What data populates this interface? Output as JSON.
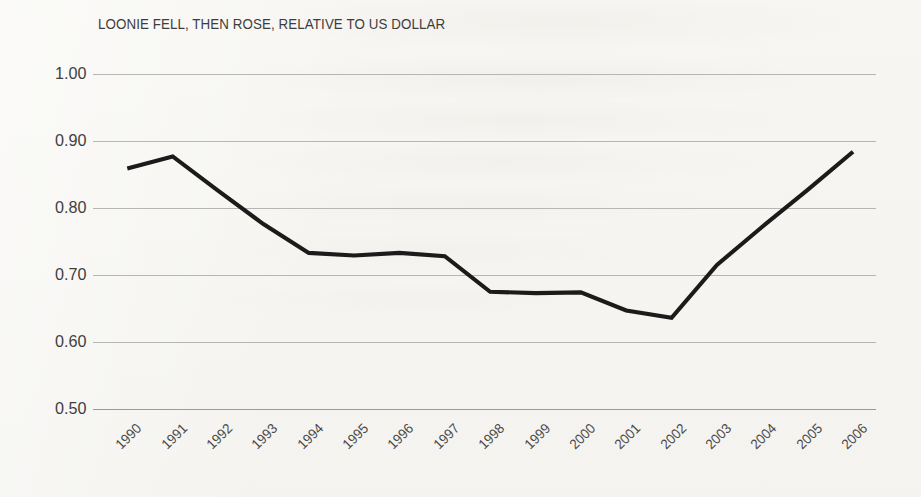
{
  "chart_data": {
    "type": "line",
    "title": "LOONIE FELL, THEN ROSE, RELATIVE TO US DOLLAR",
    "xlabel": "",
    "ylabel": "",
    "categories": [
      "1990",
      "1991",
      "1992",
      "1993",
      "1994",
      "1995",
      "1996",
      "1997",
      "1998",
      "1999",
      "2000",
      "2001",
      "2002",
      "2003",
      "2004",
      "2005",
      "2006"
    ],
    "values": [
      0.86,
      0.88,
      0.83,
      0.78,
      0.73,
      0.73,
      0.73,
      0.73,
      0.67,
      0.67,
      0.67,
      0.65,
      0.64,
      0.71,
      0.77,
      0.83,
      0.88
    ],
    "series": [
      {
        "name": "CAD per USD",
        "values": [
          0.859,
          0.877,
          0.826,
          0.776,
          0.733,
          0.729,
          0.733,
          0.728,
          0.675,
          0.673,
          0.674,
          0.647,
          0.636,
          0.715,
          0.772,
          0.827,
          0.884
        ]
      }
    ],
    "ylim": [
      0.5,
      1.0
    ],
    "ytick_labels": [
      "1.00",
      "0.90",
      "0.80",
      "0.70",
      "0.60",
      "0.50"
    ],
    "ytick_values": [
      1.0,
      0.9,
      0.8,
      0.7,
      0.6,
      0.5
    ],
    "grid": true,
    "legend": false,
    "legend_position": "none",
    "line_color": "#1b1b1b",
    "grid_color": "#b6b6b6",
    "axis_color": "#9a9a9a",
    "text_color": "#3d3d3d",
    "background_color": "#f6f5f1",
    "xtick_rotation": -45,
    "annotations": []
  }
}
